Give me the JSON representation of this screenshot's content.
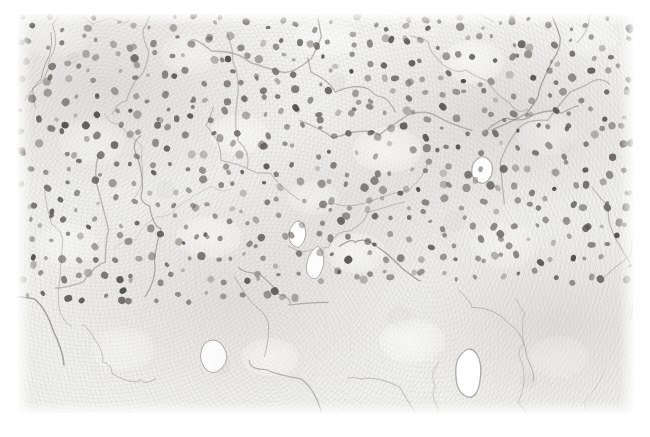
{
  "page": {
    "background_color": "#ffffff",
    "width": 650,
    "height": 437
  },
  "figure": {
    "kind": "histopathology-micrograph",
    "frame": {
      "x": 18,
      "y": 14,
      "width": 615,
      "height": 399
    },
    "stain_appearance": "desaturated / near-grayscale H&E",
    "palette": {
      "background": "#f3f3f1",
      "cytoplasm_light": "#f6f6f5",
      "cytoplasm_mid": "#e3e2df",
      "nucleus_dark": "#4a4845",
      "nucleus_mid": "#6e6b67",
      "nucleus_light": "#908d88",
      "stroma_line": "#8e8b86",
      "vessel_lumen": "#ffffff"
    },
    "caption": "",
    "label": ""
  },
  "texture": {
    "nucleus_count": 620,
    "nucleus_radius_px": [
      2.0,
      4.2
    ],
    "stroma_strand_count": 26,
    "clearing_count": 18,
    "vessel_lumen_count": 5
  }
}
